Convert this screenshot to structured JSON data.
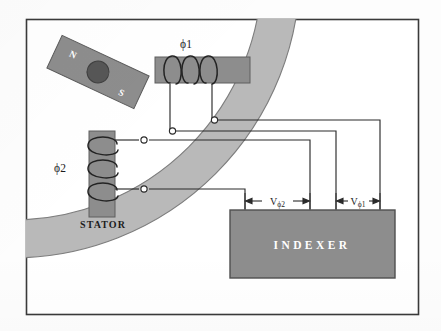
{
  "figure": {
    "kind": "technical-diagram",
    "background_color": "#fdfdfd",
    "border_color": "#3a3a3a"
  },
  "labels": {
    "phase1": "ϕ1",
    "phase2": "ϕ2",
    "stator": "STATOR",
    "indexer": "INDEXER",
    "magnet_north": "N",
    "magnet_south": "S",
    "voltage_phase2": "V",
    "voltage_phase2_sub": "ϕ2",
    "voltage_phase1": "V",
    "voltage_phase1_sub": "ϕ1"
  },
  "colors": {
    "stator_arc": "#b9b9b9",
    "stator_arc_edge": "#7d7d7d",
    "coil_core": "#8d8d8d",
    "coil_core_edge": "#5e5e5e",
    "magnet_body": "#8d8d8d",
    "magnet_edge": "#5a5a5a",
    "magnet_pivot": "#565656",
    "indexer_box": "#8d8d8d",
    "indexer_box_edge": "#4f4f4f",
    "wire": "#2b2b2b",
    "terminal_fill": "#ffffff",
    "text_dark": "#1c1c1c",
    "text_light": "#ffffff"
  },
  "components": {
    "magnet": {
      "name": "rotor-bar-magnet",
      "rotation_deg": 25,
      "poles": [
        "N",
        "S"
      ]
    },
    "coil_phase1": {
      "orientation": "horizontal",
      "turns": 3,
      "terminal_count": 2
    },
    "coil_phase2": {
      "orientation": "vertical",
      "turns": 3,
      "terminal_count": 2
    },
    "indexer": {
      "inputs": 4,
      "measurements": [
        "Vϕ2",
        "Vϕ1"
      ]
    }
  }
}
